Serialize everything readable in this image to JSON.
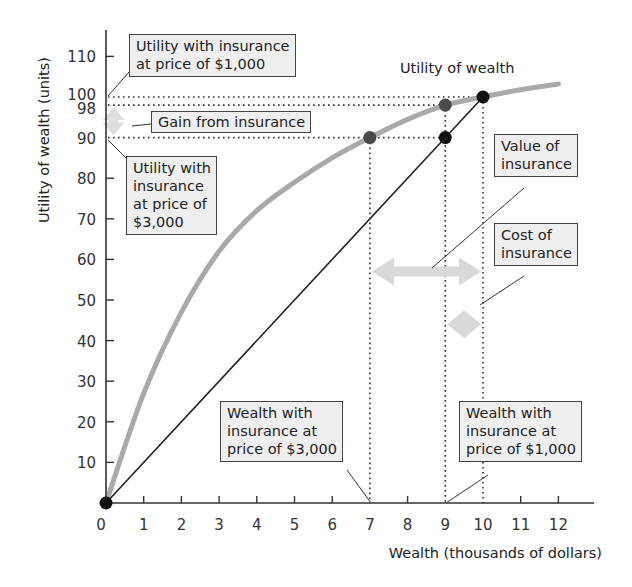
{
  "chart_data": {
    "type": "line",
    "title": "",
    "xlabel": "Wealth (thousands of dollars)",
    "ylabel": "Utility of wealth (units)",
    "xlim": [
      0,
      13
    ],
    "ylim": [
      0,
      115
    ],
    "x_ticks": [
      0,
      1,
      2,
      3,
      4,
      5,
      6,
      7,
      8,
      9,
      10,
      11,
      12
    ],
    "y_ticks": [
      10,
      20,
      30,
      40,
      50,
      60,
      70,
      80,
      90,
      98,
      100,
      110
    ],
    "grid": false,
    "series": [
      {
        "name": "Utility of wealth",
        "style": "thick gray curve",
        "color": "#a9a9a9",
        "x": [
          0,
          1,
          2,
          3,
          4,
          5,
          6,
          7,
          8,
          9,
          10,
          11,
          12
        ],
        "y": [
          0,
          27,
          47,
          62,
          72,
          79,
          85,
          90,
          94.5,
          98,
          100,
          101.8,
          103.2
        ]
      },
      {
        "name": "Expected utility line",
        "style": "thin black line",
        "color": "#222222",
        "x": [
          0,
          10
        ],
        "y": [
          0,
          100
        ]
      }
    ],
    "points": [
      {
        "x": 0,
        "y": 0,
        "color": "#111111"
      },
      {
        "x": 7,
        "y": 90,
        "color": "#4a4a4a"
      },
      {
        "x": 9,
        "y": 98,
        "color": "#4a4a4a"
      },
      {
        "x": 9,
        "y": 90,
        "color": "#111111"
      },
      {
        "x": 10,
        "y": 100,
        "color": "#111111"
      }
    ],
    "reference_lines": {
      "horizontal": [
        100,
        98,
        90
      ],
      "vertical": [
        7,
        9,
        10
      ]
    },
    "arrows": [
      {
        "name": "Gain from insurance",
        "orientation": "vertical",
        "x": 0.2,
        "y_from": 90,
        "y_to": 98
      },
      {
        "name": "Value of insurance",
        "orientation": "horizontal",
        "y": 57,
        "x_from": 7,
        "x_to": 10
      },
      {
        "name": "Cost of insurance",
        "orientation": "horizontal",
        "y": 44,
        "x_from": 9,
        "x_to": 10
      }
    ],
    "annotations": [
      "Utility of wealth",
      "Utility with insurance at price of $1,000",
      "Gain from insurance",
      "Utility with insurance at price of $3,000",
      "Value of insurance",
      "Cost of insurance",
      "Wealth with insurance at price of $3,000",
      "Wealth with insurance at price of $1,000"
    ]
  },
  "labels": {
    "curve": "Utility of wealth",
    "util_1000": "Utility with insurance\nat price of $1,000",
    "gain": "Gain from insurance",
    "util_3000": "Utility with\ninsurance\nat price of\n$3,000",
    "value": "Value of\ninsurance",
    "cost": "Cost of\ninsurance",
    "wealth_3000": "Wealth with\ninsurance at\nprice of $3,000",
    "wealth_1000": "Wealth with\ninsurance at\nprice of $1,000"
  }
}
